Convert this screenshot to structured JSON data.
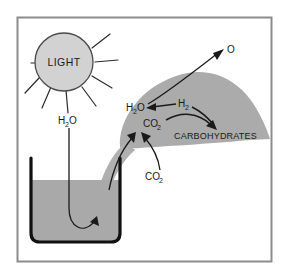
{
  "figure": {
    "border_color": "#8c8c8c",
    "background_color": "#ffffff"
  },
  "palette": {
    "leaf_fill": "#ababab",
    "sun_fill": "#d2d2d2",
    "water_fill": "#a9a9a9",
    "stem_fill": "#b0b0b0",
    "stroke_dark": "#1a1a1a",
    "outline_gray": "#6e6e6e"
  },
  "sun": {
    "label": "LIGHT",
    "ray_count": 8
  },
  "labels": {
    "water_source": "H2O",
    "water_source_display": "H",
    "water_in_leaf": "H2O",
    "hydrogen": "H2",
    "carbon_dioxide_leaf": "CO2",
    "carbon_dioxide_external": "CO2",
    "oxygen": "O",
    "carbohydrates": "CARBOHYDRATES"
  },
  "formulas": {
    "h2o": {
      "base1": "H",
      "sub1": "2",
      "base2": "O"
    },
    "h2": {
      "base1": "H",
      "sub1": "2"
    },
    "co2": {
      "base1": "CO",
      "sub1": "2"
    },
    "o": {
      "base1": "O"
    }
  },
  "elements": {
    "beaker_name": "water-beaker",
    "leaf_name": "leaf-shape",
    "stem_name": "plant-stem",
    "sun_name": "sun-shape"
  }
}
